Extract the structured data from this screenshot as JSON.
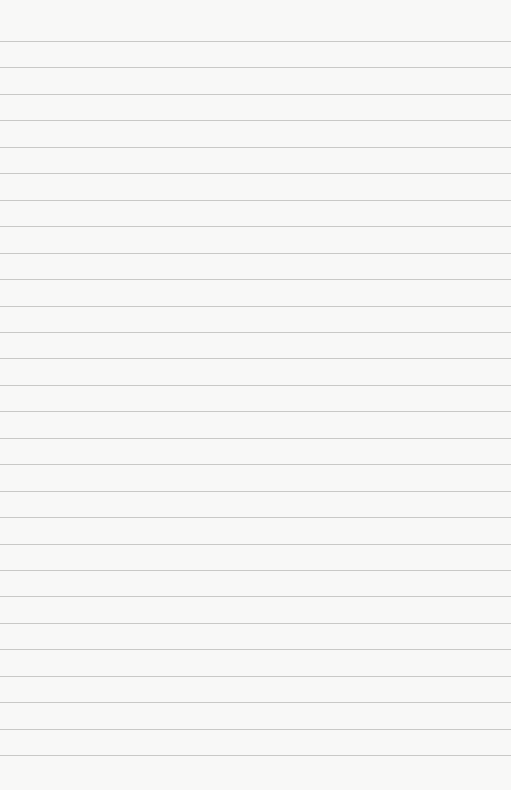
{
  "page": {
    "type": "lined-paper",
    "background_color": "#f8f8f7",
    "rule_color": "#c9c9c7",
    "first_rule_y": 41,
    "rule_spacing": 26.45,
    "rule_count": 28
  }
}
